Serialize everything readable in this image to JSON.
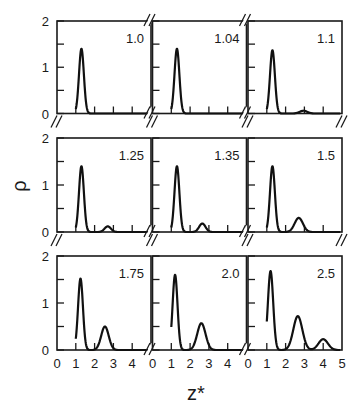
{
  "chart_data": {
    "type": "line",
    "layout": "3x3 small multiples",
    "xlabel": "z*",
    "ylabel": "ρ",
    "xlim": [
      0,
      5
    ],
    "ylim": [
      0,
      2
    ],
    "x_ticks": [
      0,
      1,
      2,
      3,
      4
    ],
    "x_ticks_last_column": [
      0,
      1,
      2,
      3,
      4,
      5
    ],
    "y_ticks": [
      0,
      0.5,
      1,
      1.5,
      2
    ],
    "y_tick_labels": [
      "0",
      "1",
      "2"
    ],
    "grid": false,
    "legend": null,
    "panels": [
      {
        "label": "1.0",
        "row": 0,
        "col": 0,
        "peaks": [
          {
            "z": 1.3,
            "rho": 1.4,
            "width": 0.13
          }
        ]
      },
      {
        "label": "1.04",
        "row": 0,
        "col": 1,
        "peaks": [
          {
            "z": 1.3,
            "rho": 1.4,
            "width": 0.13
          }
        ]
      },
      {
        "label": "1.1",
        "row": 0,
        "col": 2,
        "peaks": [
          {
            "z": 1.3,
            "rho": 1.37,
            "width": 0.13
          },
          {
            "z": 2.95,
            "rho": 0.06,
            "width": 0.2
          }
        ]
      },
      {
        "label": "1.25",
        "row": 1,
        "col": 0,
        "peaks": [
          {
            "z": 1.3,
            "rho": 1.4,
            "width": 0.13
          },
          {
            "z": 2.7,
            "rho": 0.12,
            "width": 0.17
          }
        ]
      },
      {
        "label": "1.35",
        "row": 1,
        "col": 1,
        "peaks": [
          {
            "z": 1.3,
            "rho": 1.4,
            "width": 0.13
          },
          {
            "z": 2.65,
            "rho": 0.18,
            "width": 0.17
          }
        ]
      },
      {
        "label": "1.5",
        "row": 1,
        "col": 2,
        "peaks": [
          {
            "z": 1.3,
            "rho": 1.4,
            "width": 0.13
          },
          {
            "z": 2.7,
            "rho": 0.3,
            "width": 0.22
          }
        ]
      },
      {
        "label": "1.75",
        "row": 2,
        "col": 0,
        "peaks": [
          {
            "z": 1.25,
            "rho": 1.52,
            "width": 0.13
          },
          {
            "z": 2.55,
            "rho": 0.5,
            "width": 0.2
          }
        ]
      },
      {
        "label": "2.0",
        "row": 2,
        "col": 1,
        "peaks": [
          {
            "z": 1.2,
            "rho": 1.6,
            "width": 0.13
          },
          {
            "z": 2.6,
            "rho": 0.57,
            "width": 0.22
          }
        ]
      },
      {
        "label": "2.5",
        "row": 2,
        "col": 2,
        "peaks": [
          {
            "z": 1.2,
            "rho": 1.68,
            "width": 0.14
          },
          {
            "z": 2.65,
            "rho": 0.72,
            "width": 0.24
          },
          {
            "z": 4.0,
            "rho": 0.23,
            "width": 0.25
          }
        ]
      }
    ]
  },
  "labels": {
    "xlabel": "z*",
    "ylabel": "ρ"
  }
}
